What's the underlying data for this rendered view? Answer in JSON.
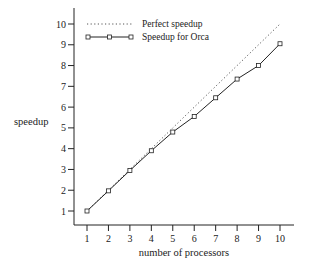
{
  "chart_data": {
    "type": "line",
    "title": "",
    "xlabel": "number of processors",
    "ylabel": "speedup",
    "x": [
      1,
      2,
      3,
      4,
      5,
      6,
      7,
      8,
      9,
      10
    ],
    "xticks": [
      "1",
      "2",
      "3",
      "4",
      "5",
      "6",
      "7",
      "8",
      "9",
      "10"
    ],
    "yticks": [
      "1",
      "2",
      "3",
      "4",
      "5",
      "6",
      "7",
      "8",
      "9",
      "10"
    ],
    "xlim": [
      0.4,
      10.7
    ],
    "ylim": [
      0.3,
      10.7
    ],
    "grid": false,
    "legend_position": "upper-left",
    "series": [
      {
        "name": "Perfect speedup",
        "style": "dotted",
        "marker": "none",
        "values": [
          1,
          2,
          3,
          4,
          5,
          6,
          7,
          8,
          9,
          10
        ]
      },
      {
        "name": "Speedup for Orca",
        "style": "solid",
        "marker": "square",
        "values": [
          1.0,
          1.97,
          2.95,
          3.9,
          4.8,
          5.55,
          6.45,
          7.35,
          8.0,
          9.05
        ]
      }
    ]
  },
  "legend": {
    "items": [
      {
        "label": "Perfect speedup"
      },
      {
        "label": "Speedup for Orca"
      }
    ]
  }
}
